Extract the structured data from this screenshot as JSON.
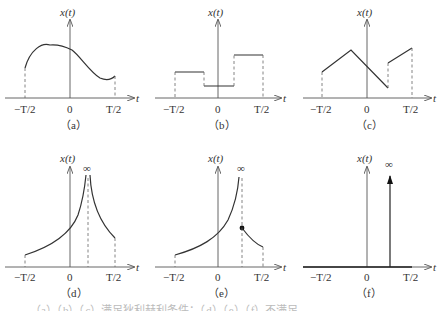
{
  "figure": {
    "y_axis_label": "x(t)",
    "x_axis_label": "t",
    "ticks": {
      "neg": "−T/2",
      "zero": "0",
      "pos": "T/2"
    },
    "infinity_symbol": "∞",
    "panels": [
      {
        "id": "a",
        "caption": "（a）",
        "description": "smooth bounded curve on [-T/2, T/2]"
      },
      {
        "id": "b",
        "caption": "（b）",
        "description": "piecewise-constant function with finite jumps"
      },
      {
        "id": "c",
        "caption": "（c）",
        "description": "piecewise-linear function with a finite discontinuity"
      },
      {
        "id": "d",
        "caption": "（d）",
        "description": "function tending to infinity from both sides at an interior point"
      },
      {
        "id": "e",
        "caption": "（e）",
        "description": "function tending to infinity from the left, finite from the right (dot)"
      },
      {
        "id": "f",
        "caption": "（f）",
        "description": "impulse (delta) at an interior point"
      }
    ],
    "footer_cut": "（a）（b）（c）满足狄利赫利条件；（d）（e）（f）不满足"
  }
}
